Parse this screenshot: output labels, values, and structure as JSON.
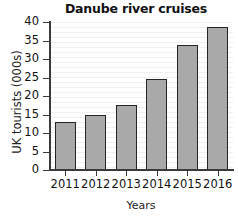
{
  "chart_data": {
    "type": "bar",
    "title": "Danube river cruises",
    "xlabel": "Years",
    "ylabel": "UK tourists (000s)",
    "categories": [
      "2011",
      "2012",
      "2013",
      "2014",
      "2015",
      "2016"
    ],
    "values": [
      13,
      15,
      17.5,
      24.5,
      33.8,
      38.7
    ],
    "ylim": [
      0,
      40
    ],
    "ytick_step": 5,
    "yticks": [
      "0",
      "5",
      "10",
      "15",
      "20",
      "25",
      "30",
      "35",
      "40"
    ],
    "grid": "horizontal",
    "legend": "none",
    "bar_color": "#a9a9a9",
    "bar_edge_color": "#242424",
    "axis_color": "#3a3a3a",
    "background": "#ffffff"
  }
}
